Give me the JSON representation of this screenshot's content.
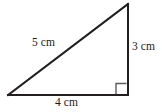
{
  "figure": {
    "shape": "right triangle",
    "background_color": "#ffffff",
    "stroke_color": "#231f20",
    "text_color": "#1a1a1a",
    "labels": {
      "hypotenuse": "5 cm",
      "vertical_side": "3 cm",
      "base_side": "4 cm"
    },
    "measurements": [
      {
        "side": "hypotenuse",
        "value": 5,
        "unit": "cm",
        "text": "5 cm"
      },
      {
        "side": "vertical",
        "value": 3,
        "unit": "cm",
        "text": "3 cm"
      },
      {
        "side": "base",
        "value": 4,
        "unit": "cm",
        "text": "4 cm"
      }
    ],
    "right_angle": {
      "present": true,
      "location": "bottom-right vertex",
      "marker": "square"
    },
    "vertices": {
      "bottom_left": [
        8,
        95
      ],
      "bottom_right": [
        128,
        95
      ],
      "top_right": [
        128,
        4
      ]
    }
  }
}
